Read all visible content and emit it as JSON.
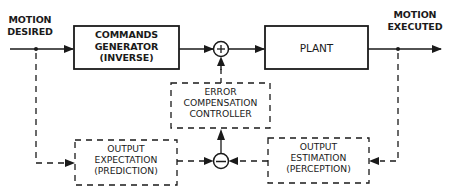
{
  "diagram": {
    "colors": {
      "line": "#1a1a1a",
      "background": "#ffffff"
    },
    "input_label": {
      "line1": "MOTION",
      "line2": "DESIRED"
    },
    "output_label": {
      "line1": "MOTION",
      "line2": "EXECUTED"
    },
    "blocks": [
      {
        "id": "commands-generator",
        "line1": "COMMANDS",
        "line2": "GENERATOR",
        "line3": "(INVERSE)",
        "style": "solid"
      },
      {
        "id": "plant",
        "line1": "PLANT",
        "style": "solid"
      },
      {
        "id": "error-compensation-controller",
        "line1": "ERROR",
        "line2": "COMPENSATION",
        "line3": "CONTROLLER",
        "style": "dashed"
      },
      {
        "id": "output-expectation",
        "line1": "OUTPUT",
        "line2": "EXPECTATION",
        "line3": "(PREDICTION)",
        "style": "dashed"
      },
      {
        "id": "output-estimation",
        "line1": "OUTPUT",
        "line2": "ESTIMATION",
        "line3": "(PERCEPTION)",
        "style": "dashed"
      }
    ],
    "junctions": [
      {
        "id": "sum-top",
        "sign": "+"
      },
      {
        "id": "sum-bottom",
        "sign": "−"
      }
    ]
  }
}
